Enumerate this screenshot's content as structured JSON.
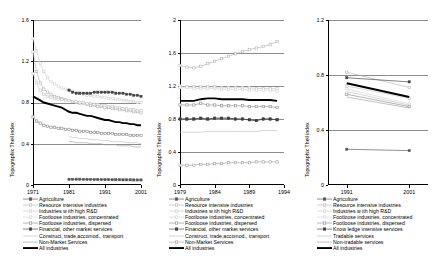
{
  "figure": {
    "panels": [
      "France",
      "Spain",
      "Portugal"
    ],
    "shared_ylabel": "Topographic Theil index",
    "means_label": "Means"
  },
  "chart_data": [
    {
      "type": "line",
      "title": "France",
      "xlabel": "",
      "ylabel": "Topographic Theil index",
      "xlim": [
        1971,
        2001
      ],
      "ylim": [
        0,
        1.6
      ],
      "xticks": [
        1971,
        1981,
        1991,
        2001
      ],
      "yticks": [
        0,
        0.4,
        0.8,
        1.2,
        1.6
      ],
      "ytick_labels": [
        "0",
        "0.4",
        "0.8",
        "1.2",
        "1.6"
      ],
      "grid": true,
      "annotation": "Means",
      "legend_position": "below",
      "x": [
        1971,
        1972,
        1973,
        1974,
        1975,
        1976,
        1977,
        1978,
        1979,
        1980,
        1981,
        1982,
        1983,
        1984,
        1985,
        1986,
        1987,
        1988,
        1989,
        1990,
        1991,
        1992,
        1993,
        1994,
        1995,
        1996,
        1997,
        1998,
        1999,
        2000,
        2001
      ],
      "series": [
        {
          "name": "Agriculture",
          "color": "#555555",
          "marker": "filled-square",
          "values": [
            null,
            null,
            null,
            null,
            null,
            null,
            null,
            null,
            null,
            null,
            0.055,
            0.055,
            0.056,
            0.056,
            0.055,
            0.054,
            0.054,
            0.053,
            0.053,
            0.052,
            0.052,
            0.052,
            0.051,
            0.051,
            0.051,
            0.05,
            0.05,
            0.05,
            0.049,
            0.049,
            0.049
          ]
        },
        {
          "name": "Resource intensive industries",
          "color": "#b4b4b4",
          "marker": "open-square",
          "values": [
            1.29,
            1.1,
            0.99,
            0.93,
            0.9,
            0.88,
            0.86,
            0.85,
            0.84,
            0.83,
            0.82,
            0.81,
            0.8,
            0.79,
            0.79,
            0.78,
            0.77,
            0.77,
            0.76,
            0.76,
            0.75,
            0.75,
            0.74,
            0.74,
            0.73,
            0.73,
            0.72,
            0.72,
            0.71,
            0.71,
            0.7
          ]
        },
        {
          "name": "Industries w ith high R&D",
          "color": "#c8c8c8",
          "marker": "open-square",
          "values": [
            1.08,
            0.99,
            0.92,
            0.88,
            0.86,
            0.85,
            0.84,
            0.83,
            0.83,
            0.82,
            0.82,
            0.81,
            0.81,
            0.8,
            0.8,
            0.79,
            0.79,
            0.78,
            0.78,
            0.77,
            0.77,
            0.76,
            0.76,
            0.75,
            0.75,
            0.74,
            0.74,
            0.73,
            0.73,
            0.72,
            0.72
          ]
        },
        {
          "name": "Footloose industries, concentrated",
          "color": "#d2d2d2",
          "marker": "open-square",
          "values": [
            1.42,
            1.3,
            1.18,
            1.1,
            1.04,
            1.0,
            0.98,
            0.96,
            0.94,
            0.93,
            0.92,
            0.91,
            0.9,
            0.89,
            0.88,
            0.87,
            0.87,
            0.86,
            0.86,
            0.85,
            0.85,
            0.84,
            0.84,
            0.83,
            0.83,
            0.82,
            0.82,
            0.81,
            0.81,
            0.8,
            0.8
          ]
        },
        {
          "name": "Footloose industries, dispersed",
          "color": "#8c8c8c",
          "marker": "open-square",
          "values": [
            0.66,
            0.62,
            0.6,
            0.58,
            0.57,
            0.56,
            0.56,
            0.55,
            0.55,
            0.54,
            0.54,
            0.53,
            0.53,
            0.52,
            0.52,
            0.52,
            0.51,
            0.51,
            0.51,
            0.5,
            0.5,
            0.5,
            0.5,
            0.49,
            0.49,
            0.49,
            0.49,
            0.48,
            0.48,
            0.48,
            0.48
          ]
        },
        {
          "name": "Financial, other market services",
          "color": "#404040",
          "marker": "filled-square",
          "values": [
            null,
            null,
            null,
            null,
            null,
            null,
            null,
            null,
            null,
            null,
            0.92,
            0.9,
            0.89,
            0.89,
            0.89,
            0.89,
            0.89,
            0.9,
            0.9,
            0.9,
            0.9,
            0.9,
            0.9,
            0.89,
            0.89,
            0.89,
            0.88,
            0.88,
            0.87,
            0.87,
            0.86
          ]
        },
        {
          "name": "Construct, trade,accomod., transport",
          "color": "#bebebe",
          "marker": "none",
          "values": [
            null,
            null,
            null,
            null,
            null,
            null,
            null,
            null,
            null,
            null,
            0.47,
            0.46,
            0.46,
            0.45,
            0.45,
            0.45,
            0.44,
            0.44,
            0.44,
            0.43,
            0.43,
            0.43,
            0.42,
            0.42,
            0.42,
            0.42,
            0.41,
            0.41,
            0.41,
            0.41,
            0.4
          ]
        },
        {
          "name": "Non-Market Services",
          "color": "#a0a0a0",
          "marker": "none",
          "values": [
            null,
            null,
            null,
            null,
            null,
            null,
            null,
            null,
            null,
            null,
            0.42,
            0.42,
            0.41,
            0.41,
            0.41,
            0.41,
            0.4,
            0.4,
            0.4,
            0.4,
            0.39,
            0.39,
            0.39,
            0.39,
            0.38,
            0.38,
            0.38,
            0.38,
            0.37,
            0.37,
            0.37
          ]
        },
        {
          "name": "All industries",
          "color": "#000000",
          "marker": "none",
          "values": [
            0.86,
            0.84,
            0.82,
            0.8,
            0.79,
            0.78,
            0.77,
            0.76,
            0.75,
            0.73,
            0.71,
            0.7,
            0.7,
            0.69,
            0.68,
            0.67,
            0.67,
            0.66,
            0.65,
            0.64,
            0.63,
            0.63,
            0.62,
            0.61,
            0.61,
            0.6,
            0.6,
            0.59,
            0.59,
            0.58,
            0.58
          ]
        }
      ],
      "legend": [
        "Agriculture",
        "Resource intensive industries",
        "Industries w ith high R&D",
        "Footloose industries, concentrated",
        "Footloose industries, dispersed",
        "Financial, other market services",
        "Construct, trade,accomod., transport",
        "Non-Market Services",
        "All industries"
      ]
    },
    {
      "type": "line",
      "title": "Spain",
      "xlabel": "",
      "ylabel": "Topographic Theil index",
      "xlim": [
        1979,
        1994
      ],
      "ylim": [
        0,
        2
      ],
      "xticks": [
        1979,
        1984,
        1989,
        1994
      ],
      "yticks": [
        0,
        0.4,
        0.8,
        1.2,
        1.6,
        2
      ],
      "ytick_labels": [
        "0",
        "0.4",
        "0.8",
        "1.2",
        "1.6",
        "2"
      ],
      "grid": true,
      "annotation": "Means",
      "legend_position": "below",
      "x": [
        1979,
        1980,
        1981,
        1982,
        1983,
        1984,
        1985,
        1986,
        1987,
        1988,
        1989,
        1990,
        1991,
        1992,
        1993
      ],
      "series": [
        {
          "name": "Agriculture",
          "color": "#555555",
          "marker": "filled-square",
          "values": [
            0.8,
            0.8,
            0.8,
            0.81,
            0.8,
            0.81,
            0.81,
            0.81,
            0.8,
            0.8,
            0.79,
            0.78,
            0.8,
            0.8,
            0.79
          ]
        },
        {
          "name": "Resource intensive industries",
          "color": "#b4b4b4",
          "marker": "open-square",
          "values": [
            1.45,
            1.43,
            1.42,
            1.44,
            1.47,
            1.5,
            1.53,
            1.56,
            1.59,
            1.62,
            1.64,
            1.66,
            1.68,
            1.7,
            1.74
          ]
        },
        {
          "name": "Industries w ith high R&D",
          "color": "#c8c8c8",
          "marker": "open-square",
          "values": [
            1.2,
            1.19,
            1.19,
            1.19,
            1.19,
            1.19,
            1.18,
            1.18,
            1.18,
            1.18,
            1.18,
            1.17,
            1.17,
            1.17,
            1.17
          ]
        },
        {
          "name": "Footloose industries, concentrated",
          "color": "#d2d2d2",
          "marker": "open-square",
          "values": [
            1.18,
            1.18,
            1.17,
            1.17,
            1.17,
            1.17,
            1.16,
            1.16,
            1.16,
            1.16,
            1.15,
            1.15,
            1.15,
            1.15,
            1.14
          ]
        },
        {
          "name": "Footloose industries, dispersed",
          "color": "#8c8c8c",
          "marker": "open-square",
          "values": [
            0.97,
            0.97,
            0.97,
            0.99,
            0.97,
            0.97,
            0.96,
            0.96,
            0.96,
            0.96,
            0.95,
            0.95,
            0.95,
            0.95,
            0.94
          ]
        },
        {
          "name": "Financial, other market services",
          "color": "#404040",
          "marker": "filled-square",
          "values": [
            0.8,
            0.8,
            0.8,
            0.81,
            0.8,
            0.81,
            0.81,
            0.81,
            0.8,
            0.8,
            0.79,
            0.78,
            0.8,
            0.8,
            0.79
          ]
        },
        {
          "name": "Construct, trade,accomod., transport",
          "color": "#bebebe",
          "marker": "none",
          "values": [
            0.64,
            0.64,
            0.64,
            0.64,
            0.65,
            0.65,
            0.65,
            0.65,
            0.65,
            0.65,
            0.65,
            0.65,
            0.66,
            0.66,
            0.66
          ]
        },
        {
          "name": "Non-Market Services",
          "color": "#a0a0a0",
          "marker": "open-square",
          "values": [
            0.24,
            0.24,
            0.24,
            0.25,
            0.25,
            0.26,
            0.26,
            0.27,
            0.27,
            0.27,
            0.27,
            0.28,
            0.28,
            0.28,
            0.28
          ]
        },
        {
          "name": "All industries",
          "color": "#000000",
          "marker": "none",
          "values": [
            1.02,
            1.02,
            1.02,
            1.04,
            1.05,
            1.05,
            1.04,
            1.04,
            1.04,
            1.04,
            1.03,
            1.03,
            1.03,
            1.03,
            1.02
          ]
        }
      ],
      "legend": [
        "Agriculture",
        "Resource intensive industries",
        "Industries w ith high R&D",
        "Footloose industries, concentrated",
        "Footloose industries, dispersed",
        "Financial, other market services",
        "Construct, trade,accomod., transport",
        "Non-Market Services",
        "All industries"
      ]
    },
    {
      "type": "line",
      "title": "Portugal",
      "xlabel": "",
      "ylabel": "Topographic Theil index",
      "xlim": [
        1988,
        2004
      ],
      "ylim": [
        0,
        1.2
      ],
      "xticks": [
        1991,
        2001
      ],
      "yticks": [
        0,
        0.4,
        0.8,
        1.2
      ],
      "ytick_labels": [
        "0",
        "0.4",
        "0.8",
        "1.2"
      ],
      "grid": true,
      "annotation": "Means",
      "legend_position": "below",
      "x": [
        1991,
        2001
      ],
      "series": [
        {
          "name": "Agriculture",
          "color": "#555555",
          "marker": "filled-square",
          "values": [
            0.26,
            0.25
          ]
        },
        {
          "name": "Resource intensive industries",
          "color": "#b4b4b4",
          "marker": "open-square",
          "values": [
            0.82,
            0.71
          ]
        },
        {
          "name": "Industries w ith high R&D",
          "color": "#c8c8c8",
          "marker": "open-square",
          "values": [
            0.72,
            0.63
          ]
        },
        {
          "name": "Footloose industries, concentrated",
          "color": "#d2d2d2",
          "marker": "open-square",
          "values": [
            0.7,
            0.59
          ]
        },
        {
          "name": "Footloose industries, dispersed",
          "color": "#8c8c8c",
          "marker": "open-square",
          "values": [
            0.66,
            0.57
          ]
        },
        {
          "name": "Know ledge intensive services",
          "color": "#404040",
          "marker": "filled-square",
          "values": [
            0.78,
            0.75
          ]
        },
        {
          "name": "Tradable services",
          "color": "#bebebe",
          "marker": "none",
          "values": [
            0.68,
            0.58
          ]
        },
        {
          "name": "Non-tradable services",
          "color": "#a0a0a0",
          "marker": "none",
          "values": [
            0.64,
            0.56
          ]
        },
        {
          "name": "All industries",
          "color": "#000000",
          "marker": "none",
          "values": [
            0.74,
            0.64
          ]
        }
      ],
      "legend": [
        "Agriculture",
        "Resource intensive industries",
        "Industries w ith high R&D",
        "Footloose industries, concentrated",
        "Footloose industries, dispersed",
        "Know ledge intensive services",
        "Tradable services",
        "Non-tradable services",
        "All industries"
      ]
    }
  ]
}
